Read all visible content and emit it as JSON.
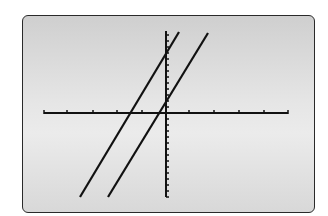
{
  "chart_data": {
    "type": "line",
    "title": "",
    "xlabel": "",
    "ylabel": "",
    "grid": false,
    "legend": null,
    "x_axis": {
      "tick_count_left": 5,
      "tick_count_right": 5,
      "range_units": [
        -5,
        5
      ]
    },
    "y_axis": {
      "tick_count_above": 9,
      "tick_count_below": 14,
      "range_units": [
        -14,
        9
      ]
    },
    "series": [
      {
        "name": "line-1",
        "slope_units_per_tick": 6.8,
        "x_intercept_ticks": -1.5,
        "y_intercept_ticks": 9.5
      },
      {
        "name": "line-2",
        "slope_units_per_tick": 6.8,
        "x_intercept_ticks": -0.3,
        "y_intercept_ticks": 2.1
      }
    ],
    "colors": {
      "screen_background": "#e4e4e4",
      "axis": "#111111",
      "lines": "#111111",
      "border": "#2a2a2a"
    }
  },
  "geometry": {
    "x_axis": {
      "y": 113,
      "x1": 44,
      "x2": 288,
      "ticks": [
        67,
        93,
        117,
        142,
        189,
        214,
        239,
        264
      ]
    },
    "y_axis": {
      "x": 166,
      "y1": 31,
      "y2": 197,
      "tick_spacing": 6
    },
    "lines": [
      {
        "x1": 80,
        "y1": 197,
        "x2": 179,
        "y2": 32
      },
      {
        "x1": 108,
        "y1": 197,
        "x2": 208,
        "y2": 33
      }
    ]
  }
}
